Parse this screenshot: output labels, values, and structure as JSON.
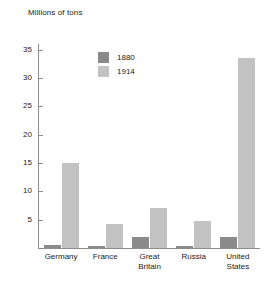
{
  "chart_data": {
    "type": "bar",
    "title": "Millions of tons",
    "xlabel": "",
    "ylabel": "Millions of tons",
    "ylim": [
      0,
      36
    ],
    "yticks": [
      5,
      10,
      15,
      20,
      25,
      30,
      35
    ],
    "ytick_labels": [
      "5",
      "10",
      "15",
      "20",
      "25",
      "30",
      "35"
    ],
    "grid": false,
    "legend_position": "upper-center-left",
    "categories": [
      "Germany",
      "France",
      "Great Britain",
      "Russia",
      "United States"
    ],
    "category_lines": [
      [
        "Germany"
      ],
      [
        "France"
      ],
      [
        "Great",
        "Britain"
      ],
      [
        "Russia"
      ],
      [
        "United",
        "States"
      ]
    ],
    "series": [
      {
        "name": "1880",
        "color": "#8a8a8a",
        "values": [
          0.5,
          0.3,
          2.0,
          0.3,
          2.0
        ]
      },
      {
        "name": "1914",
        "color": "#c2c2c2",
        "values": [
          15.0,
          4.2,
          7.1,
          4.7,
          33.5
        ]
      }
    ]
  },
  "axis": {
    "line_color": "#8d8d8d"
  }
}
